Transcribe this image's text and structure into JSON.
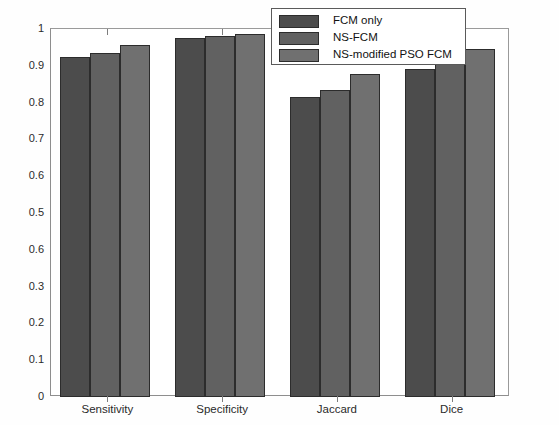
{
  "figure": {
    "background_color": "#fefefe",
    "plot_background_color": "#ffffff",
    "axis_color": "#8e8e8e"
  },
  "legend": {
    "position": "top-center-right",
    "border_color": "#5a5a5a",
    "entries": [
      {
        "label": "FCM only",
        "color": "#4c4c4c"
      },
      {
        "label": "NS-FCM",
        "color": "#616161"
      },
      {
        "label": "NS-modified PSO FCM",
        "color": "#707070"
      }
    ]
  },
  "y_axis": {
    "min": 0,
    "max": 1,
    "tick_values": [
      0,
      0.1,
      0.2,
      0.3,
      0.4,
      0.5,
      0.6,
      0.7,
      0.8,
      0.9,
      1
    ],
    "tick_labels": [
      "0",
      "0.1",
      "0.2",
      "0.3",
      "0.6",
      "0.5",
      "0.6",
      "0.7",
      "0.8",
      "0.9",
      "1"
    ],
    "label": ""
  },
  "x_axis": {
    "tick_labels": [
      "Sensitivity",
      "Specificity",
      "Jaccard",
      "Dice"
    ],
    "label": ""
  },
  "chart_data": {
    "type": "bar",
    "title": "",
    "xlabel": "",
    "ylabel": "",
    "ylim": [
      0,
      1
    ],
    "grid": false,
    "legend_position": "top-center-right",
    "categories": [
      "Sensitivity",
      "Specificity",
      "Jaccard",
      "Dice"
    ],
    "series": [
      {
        "name": "FCM only",
        "color": "#4c4c4c",
        "values": [
          0.925,
          0.976,
          0.815,
          0.891
        ]
      },
      {
        "name": "NS-FCM",
        "color": "#616161",
        "values": [
          0.936,
          0.981,
          0.834,
          0.923
        ]
      },
      {
        "name": "NS-modified PSO FCM",
        "color": "#707070",
        "values": [
          0.957,
          0.987,
          0.878,
          0.947
        ]
      }
    ]
  }
}
